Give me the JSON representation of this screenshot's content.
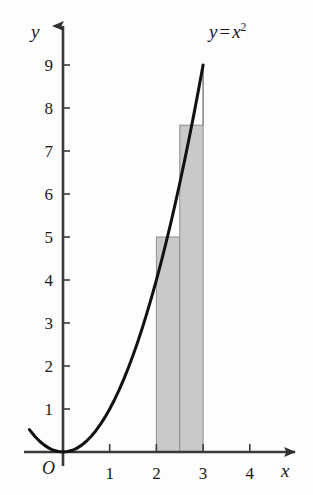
{
  "chart_data": {
    "type": "line",
    "title_parts": {
      "lhs": "y",
      "eq": "=",
      "var": "x",
      "exponent": "2"
    },
    "xlabel": "x",
    "ylabel": "y",
    "origin_label": "O",
    "xlim": [
      -0.75,
      5.0
    ],
    "ylim": [
      -0.15,
      9.6
    ],
    "grid": false,
    "legend": false,
    "xticks": [
      1,
      2,
      3,
      4
    ],
    "xtick_labels": [
      "1",
      "2",
      "3",
      "4"
    ],
    "yticks": [
      1,
      2,
      3,
      4,
      5,
      6,
      7,
      8,
      9
    ],
    "ytick_labels": [
      "1",
      "2",
      "3",
      "4",
      "5",
      "6",
      "7",
      "8",
      "9"
    ],
    "series": [
      {
        "name": "y = x²",
        "type": "line",
        "color": "#111111",
        "linewidth": 3,
        "x": [
          -0.72,
          -0.6,
          -0.5,
          -0.4,
          -0.3,
          -0.2,
          -0.1,
          0,
          0.1,
          0.2,
          0.3,
          0.4,
          0.5,
          0.6,
          0.7,
          0.8,
          0.9,
          1.0,
          1.1,
          1.2,
          1.3,
          1.4,
          1.5,
          1.6,
          1.7,
          1.8,
          1.9,
          2.0,
          2.1,
          2.2,
          2.3,
          2.4,
          2.5,
          2.6,
          2.7,
          2.8,
          2.9,
          3.0
        ],
        "y": [
          0.52,
          0.36,
          0.25,
          0.16,
          0.09,
          0.04,
          0.01,
          0,
          0.01,
          0.04,
          0.09,
          0.16,
          0.25,
          0.36,
          0.49,
          0.64,
          0.81,
          1.0,
          1.21,
          1.44,
          1.69,
          1.96,
          2.25,
          2.56,
          2.89,
          3.24,
          3.61,
          4.0,
          4.41,
          4.84,
          5.29,
          5.76,
          6.25,
          6.76,
          7.29,
          7.84,
          8.41,
          9.0
        ]
      },
      {
        "name": "riemann rectangles",
        "type": "bar",
        "fill": "#c9c9c9",
        "edge": "#8e8e8e",
        "bars": [
          {
            "x0": 2.0,
            "x1": 2.5,
            "height": 5.0
          },
          {
            "x0": 2.5,
            "x1": 3.0,
            "height": 7.6
          }
        ]
      },
      {
        "name": "vertical guide at x = 3",
        "type": "segment",
        "color": "#7a7a7a",
        "x": 3.0,
        "y0": 7.6,
        "y1": 9.0
      }
    ],
    "annotations": [
      {
        "text": "y = x²",
        "x": 3.35,
        "y": 9.3
      }
    ]
  },
  "axes": {
    "y_arrow": true,
    "x_arrow": true,
    "axis_color": "#3a3a3a"
  },
  "colors": {
    "background": "#fdfdfd",
    "curve": "#111111",
    "bar_fill": "#c9c9c9",
    "bar_edge": "#8e8e8e",
    "axis": "#3a3a3a",
    "text": "#1a1a1a"
  }
}
